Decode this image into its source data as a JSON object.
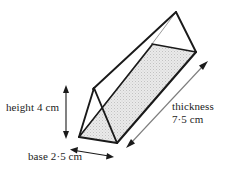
{
  "figure": {
    "type": "triangular-prism",
    "colors": {
      "outline": "#1a1a1a",
      "inner_edge": "#7a7a7a",
      "face_shading": "#e2e2e2",
      "face_shading_dots": "#bdbdbd",
      "background": "#ffffff",
      "text": "#1c1c1c"
    }
  },
  "labels": {
    "height": "height 4 cm",
    "base": "base 2·5 cm",
    "thickness_line1": "thickness",
    "thickness_line2": "7·5 cm"
  },
  "dimensions": [
    {
      "name": "height",
      "value": 4,
      "unit": "cm",
      "text": "height 4 cm"
    },
    {
      "name": "base",
      "value": 2.5,
      "unit": "cm",
      "text": "base 2·5 cm"
    },
    {
      "name": "thickness",
      "value": 7.5,
      "unit": "cm",
      "text": "thickness 7·5 cm"
    }
  ],
  "geometry": {
    "near_triangle": {
      "apex": [
        94,
        88
      ],
      "bottom_left": [
        79,
        137
      ],
      "bottom_right": [
        117,
        143
      ]
    },
    "far_triangle": {
      "apex": [
        176,
        12
      ],
      "left": [
        152,
        44
      ],
      "right": [
        196,
        52
      ]
    },
    "height_arrow": {
      "x": 66,
      "y_top": 87,
      "y_bottom": 137
    },
    "base_arrow": {
      "from": [
        72,
        150
      ],
      "to": [
        112,
        157
      ]
    },
    "thickness_arrow": {
      "from": [
        128,
        146
      ],
      "to": [
        206,
        62
      ]
    }
  }
}
